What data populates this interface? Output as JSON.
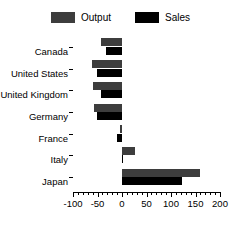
{
  "chart_data": {
    "type": "bar",
    "orientation": "horizontal",
    "title": "",
    "xlabel": "",
    "ylabel": "",
    "xlim": [
      -100,
      200
    ],
    "ylim": null,
    "grid": false,
    "legend_position": "top-center",
    "categories": [
      "Canada",
      "United States",
      "United Kingdom",
      "Germany",
      "France",
      "Italy",
      "Japan"
    ],
    "xticks": [
      -100,
      -50,
      0,
      50,
      100,
      150,
      200
    ],
    "xtick_labels": [
      "-100",
      "-50",
      "0",
      "50",
      "100",
      "150",
      "200"
    ],
    "series": [
      {
        "name": "Output",
        "color": "#3d3d3d",
        "values": [
          -42,
          -62,
          -60,
          -57,
          -5,
          27,
          160
        ]
      },
      {
        "name": "Sales",
        "color": "#000000",
        "values": [
          -32,
          -52,
          -42,
          -52,
          -10,
          3,
          122
        ]
      }
    ]
  },
  "legend": {
    "entries": [
      {
        "label": "Output",
        "color": "#3d3d3d"
      },
      {
        "label": "Sales",
        "color": "#000000"
      }
    ]
  }
}
